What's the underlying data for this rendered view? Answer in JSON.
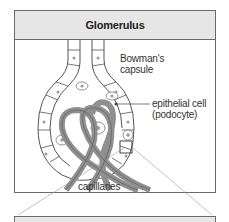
{
  "figure": {
    "title": "Glomerulus",
    "labels": {
      "bowmans_capsule_line1": "Bowman's",
      "bowmans_capsule_line2": "capsule",
      "epithelial_line1": "epithelial cell",
      "epithelial_line2": "(podocyte)",
      "capillaries": "capillaries"
    },
    "colors": {
      "header_bg": "#e6e6e6",
      "border": "#6a6a6a",
      "capillary": "#8f8f8f",
      "cell_fill": "#ffffff",
      "nucleus": "#9a9a9a"
    }
  }
}
